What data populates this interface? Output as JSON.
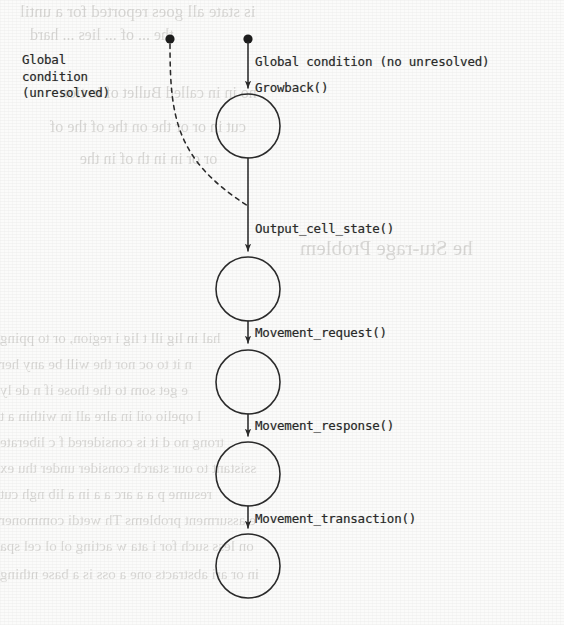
{
  "figure": {
    "kind": "state-transition-diagram",
    "width": 564,
    "height": 625,
    "background_color": "#fbfbfa",
    "ink_color": "#2b2b2b"
  },
  "labels": {
    "left_condition": "Global\ncondition\n(unresolved)",
    "top_condition": "Global condition (no unresolved)",
    "growback": "Growback()",
    "output_cell_state": "Output_cell_state()",
    "movement_request": "Movement_request()",
    "movement_response": "Movement_response()",
    "movement_transaction": "Movement_transaction()"
  },
  "nodes": [
    {
      "name": "state-node-1",
      "cx": 248,
      "cy": 126,
      "r": 32
    },
    {
      "name": "state-node-2",
      "cx": 248,
      "cy": 289,
      "r": 32
    },
    {
      "name": "state-node-3",
      "cx": 248,
      "cy": 382,
      "r": 32
    },
    {
      "name": "state-node-4",
      "cx": 248,
      "cy": 474,
      "r": 32
    },
    {
      "name": "state-node-5",
      "cx": 248,
      "cy": 566,
      "r": 32
    }
  ],
  "start_dots": [
    {
      "name": "dashed-start-dot",
      "cx": 170,
      "cy": 39,
      "r": 5
    },
    {
      "name": "solid-start-dot",
      "cx": 248,
      "cy": 39,
      "r": 5
    }
  ],
  "edges": [
    {
      "name": "edge-global-condition-no-unresolved",
      "style": "solid",
      "label": "Global condition (no unresolved)",
      "from": "solid-start-dot",
      "to": "state-node-1",
      "arrow": true
    },
    {
      "name": "edge-unresolved-feedback",
      "style": "dashed",
      "label": "Global condition (unresolved)",
      "from": "dashed-start-dot",
      "to": "edge-output-cell-state",
      "arrow": false
    },
    {
      "name": "edge-output-cell-state",
      "style": "solid",
      "label": "Output_cell_state()",
      "from": "state-node-1",
      "to": "state-node-2",
      "arrow": true
    },
    {
      "name": "edge-movement-request",
      "style": "solid",
      "label": "Movement_request()",
      "from": "state-node-2",
      "to": "state-node-3",
      "arrow": true
    },
    {
      "name": "edge-movement-response",
      "style": "solid",
      "label": "Movement_response()",
      "from": "state-node-3",
      "to": "state-node-4",
      "arrow": true
    },
    {
      "name": "edge-movement-transaction",
      "style": "solid",
      "label": "Movement_transaction()",
      "from": "state-node-4",
      "to": "state-node-5",
      "arrow": true
    }
  ],
  "ghost_text": [
    {
      "text": "is state all goes reported for a until",
      "x": 20,
      "y": 2,
      "size": 17
    },
    {
      "text": "the ... of ... lies ... hard",
      "x": 30,
      "y": 26,
      "size": 16
    },
    {
      "text": "no in in called  Bullet of in tion",
      "x": 60,
      "y": 84,
      "size": 16
    },
    {
      "text": "cut in or or the  on the of the of",
      "x": 50,
      "y": 118,
      "size": 16
    },
    {
      "text": "or or in in th of in the",
      "x": 80,
      "y": 150,
      "size": 16
    },
    {
      "text": "he Stu-rage  Problem",
      "x": 300,
      "y": 236,
      "size": 21
    },
    {
      "text": "hal in  lig  ill t lig  i  region, or to pping",
      "x": 0,
      "y": 330,
      "size": 15
    },
    {
      "text": "n it  to  oc  nor   the  will  be  any  her",
      "x": 0,
      "y": 356,
      "size": 15
    },
    {
      "text": "e  get  som  to  the  those   if  n  de  ly",
      "x": 0,
      "y": 382,
      "size": 15
    },
    {
      "text": "l  opelio    oil  in  alre  all  in  within  a  t",
      "x": 0,
      "y": 408,
      "size": 15
    },
    {
      "text": "trong  no  d  it is considered   f  c  liberate",
      "x": 0,
      "y": 434,
      "size": 15
    },
    {
      "text": "ssistant  to  our   starch   consider  under   thu  ex",
      "x": 0,
      "y": 460,
      "size": 15
    },
    {
      "text": "resume  p  a a  arc  a  a  in  a  lib  ngh  cut",
      "x": 0,
      "y": 486,
      "size": 15
    },
    {
      "text": "e  assurment  problems  Th  wetdi  commoner",
      "x": 0,
      "y": 512,
      "size": 15
    },
    {
      "text": "on  less  such  for  i  ata  w  acting  ol  ol  cel  spa",
      "x": 0,
      "y": 538,
      "size": 15
    },
    {
      "text": "in  or  ari  abstracts  one  a  oss  is  a  base  nthing",
      "x": 0,
      "y": 566,
      "size": 15
    }
  ]
}
